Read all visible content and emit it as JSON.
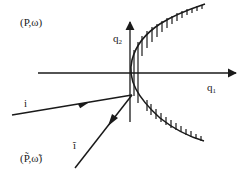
{
  "diagram": {
    "labels": {
      "top_left": "(P,ω)",
      "bottom_left": "(P̃,ω̃)",
      "q1_base": "q",
      "q1_sub": "1",
      "q2_base": "q",
      "q2_sub": "2",
      "incoming": "i",
      "outgoing": "ĩ"
    },
    "colors": {
      "ink": "#1a1a1a",
      "background": "#ffffff"
    }
  }
}
